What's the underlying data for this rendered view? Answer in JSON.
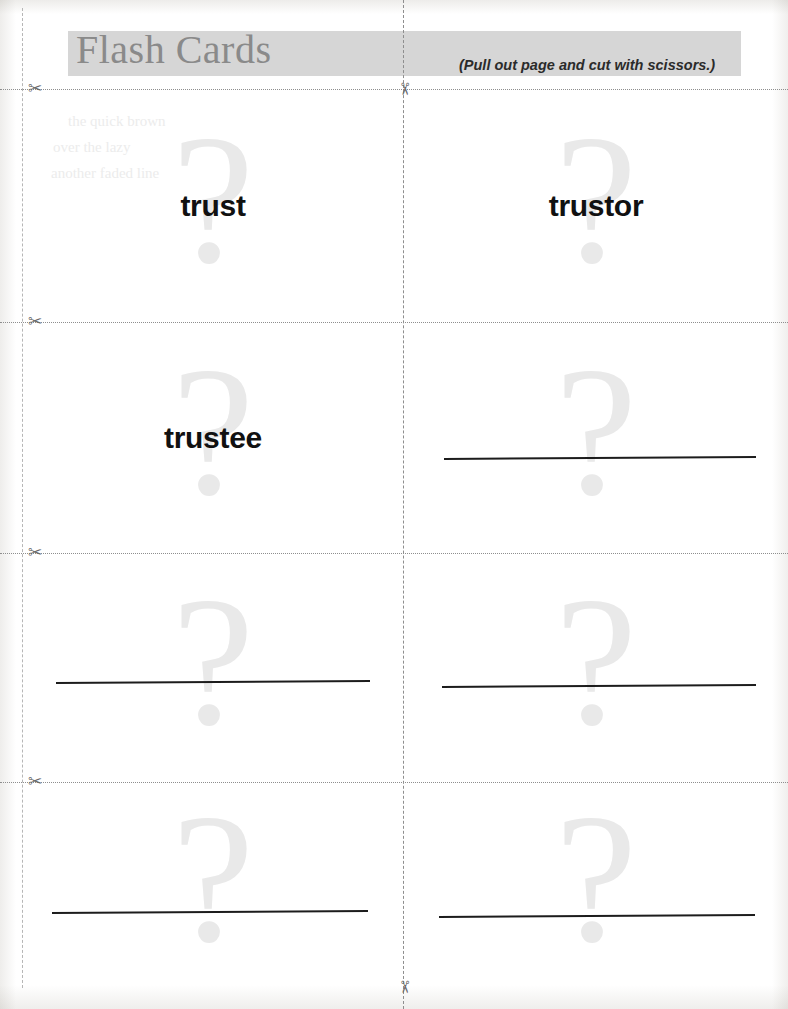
{
  "page": {
    "title": "Flash Cards",
    "note": "(Pull out page and cut with scissors.)",
    "watermark": "?",
    "colors": {
      "header_band": "#d6d6d6",
      "header_title": "#8a8a8a",
      "watermark": "#e9e9e9",
      "term_text": "#111111",
      "write_line": "#1c1c1c",
      "cut_line": "#8e8e8e",
      "paper": "#ffffff"
    },
    "icons": {
      "scissors": "✂"
    }
  },
  "cards": [
    {
      "id": "card-1",
      "row": 1,
      "column": "left",
      "term": "trust",
      "has_write_line": false
    },
    {
      "id": "card-2",
      "row": 1,
      "column": "right",
      "term": "trustor",
      "has_write_line": false
    },
    {
      "id": "card-3",
      "row": 2,
      "column": "left",
      "term": "trustee",
      "has_write_line": false
    },
    {
      "id": "card-4",
      "row": 2,
      "column": "right",
      "term": "",
      "has_write_line": true
    },
    {
      "id": "card-5",
      "row": 3,
      "column": "left",
      "term": "",
      "has_write_line": true
    },
    {
      "id": "card-6",
      "row": 3,
      "column": "right",
      "term": "",
      "has_write_line": true
    },
    {
      "id": "card-7",
      "row": 4,
      "column": "left",
      "term": "",
      "has_write_line": true
    },
    {
      "id": "card-8",
      "row": 4,
      "column": "right",
      "term": "",
      "has_write_line": true
    }
  ],
  "ghost_text": {
    "line1": "the quick brown",
    "line2": "over the lazy",
    "line3": "another faded line"
  }
}
